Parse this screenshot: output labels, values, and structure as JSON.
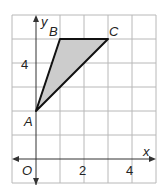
{
  "diagram": {
    "type": "coordinate-plane-triangle",
    "axes": {
      "x_label": "x",
      "y_label": "y",
      "origin_label": "O"
    },
    "x_ticks": [
      {
        "value": 2,
        "label": "2"
      },
      {
        "value": 4,
        "label": "4"
      }
    ],
    "y_ticks": [
      {
        "value": 4,
        "label": "4"
      }
    ],
    "grid": {
      "x_min": -1,
      "x_max": 5,
      "y_min": -1,
      "y_max": 7
    },
    "points": [
      {
        "name": "A",
        "x": 0,
        "y": 2
      },
      {
        "name": "B",
        "x": 1,
        "y": 5
      },
      {
        "name": "C",
        "x": 3,
        "y": 5
      }
    ],
    "fill_color": "#cccccc",
    "stroke_color": "#111111"
  }
}
